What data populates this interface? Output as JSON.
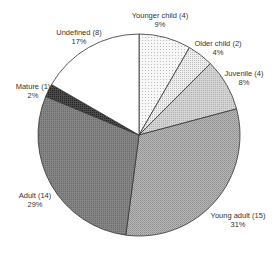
{
  "chart_data": {
    "type": "pie",
    "title": "",
    "start_angle_deg": 0,
    "direction": "clockwise",
    "center": [
      139,
      135
    ],
    "radius": 101,
    "slices": [
      {
        "label": "Younger child (4)",
        "name": "Younger child",
        "count": 4,
        "percent": "9%",
        "value": 4,
        "fill": "#f2f2f2",
        "pattern": "dots-light",
        "label_pos": [
          160,
          12
        ]
      },
      {
        "label": "Older child (2)",
        "name": "Older child",
        "count": 2,
        "percent": "4%",
        "value": 2,
        "fill": "#e4e4e4",
        "pattern": "dots",
        "label_pos": [
          218,
          40
        ]
      },
      {
        "label": "Juvenile (4)",
        "name": "Juvenile",
        "count": 4,
        "percent": "8%",
        "value": 4,
        "fill": "#cbcbcb",
        "pattern": "fine",
        "label_pos": [
          244,
          70
        ]
      },
      {
        "label": "Young adult (15)",
        "name": "Young adult",
        "count": 15,
        "percent": "31%",
        "value": 15,
        "fill": "#aaaaaa",
        "pattern": "checker",
        "label_pos": [
          238,
          212
        ]
      },
      {
        "label": "Adult (14)",
        "name": "Adult",
        "count": 14,
        "percent": "29%",
        "value": 14,
        "fill": "#7c7c7c",
        "pattern": "dense",
        "label_pos": [
          35,
          192
        ]
      },
      {
        "label": "Mature (1)",
        "name": "Mature",
        "count": 1,
        "percent": "2%",
        "value": 1,
        "fill": "#3c3c3c",
        "pattern": "dark",
        "label_pos": [
          33,
          83
        ]
      },
      {
        "label": "Undefined (8)",
        "name": "Undefined",
        "count": 8,
        "percent": "17%",
        "value": 8,
        "fill": "#ffffff",
        "pattern": "none",
        "label_pos": [
          79,
          29
        ]
      }
    ],
    "legend": "none",
    "stroke": "#333333"
  }
}
